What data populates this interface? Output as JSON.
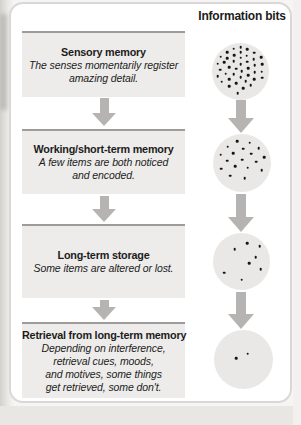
{
  "heading": "Information bits",
  "stages": [
    {
      "title": "Sensory memory",
      "description": "The senses momentarily register\namazing detail."
    },
    {
      "title": "Working/short-term memory",
      "description": "A few items are both noticed\nand encoded."
    },
    {
      "title": "Long-term storage",
      "description": "Some items are altered or lost."
    },
    {
      "title": "Retrieval from long-term memory",
      "description": "Depending on interference,\nretrieval cues, moods,\nand motives, some things\nget retrieved, some don't."
    }
  ],
  "circles": [
    {
      "name": "sensory-memory-bits",
      "dot_count": 42,
      "dots": [
        [
          50,
          7
        ],
        [
          38,
          10
        ],
        [
          62,
          11
        ],
        [
          27,
          16
        ],
        [
          74,
          17
        ],
        [
          50,
          16
        ],
        [
          15,
          24
        ],
        [
          39,
          21
        ],
        [
          61,
          22
        ],
        [
          86,
          25
        ],
        [
          27,
          27
        ],
        [
          50,
          26
        ],
        [
          73,
          28
        ],
        [
          10,
          36
        ],
        [
          21,
          34
        ],
        [
          38,
          32
        ],
        [
          62,
          33
        ],
        [
          88,
          37
        ],
        [
          50,
          37
        ],
        [
          75,
          39
        ],
        [
          30,
          42
        ],
        [
          14,
          47
        ],
        [
          42,
          45
        ],
        [
          63,
          44
        ],
        [
          87,
          50
        ],
        [
          52,
          49
        ],
        [
          75,
          51
        ],
        [
          24,
          54
        ],
        [
          38,
          55
        ],
        [
          64,
          56
        ],
        [
          10,
          58
        ],
        [
          50,
          60
        ],
        [
          88,
          61
        ],
        [
          30,
          64
        ],
        [
          74,
          64
        ],
        [
          59,
          67
        ],
        [
          17,
          68
        ],
        [
          42,
          71
        ],
        [
          68,
          74
        ],
        [
          30,
          76
        ],
        [
          55,
          79
        ],
        [
          45,
          88
        ]
      ]
    },
    {
      "name": "working-memory-bits",
      "dot_count": 18,
      "dots": [
        [
          42,
          12
        ],
        [
          63,
          15
        ],
        [
          25,
          22
        ],
        [
          79,
          24
        ],
        [
          52,
          25
        ],
        [
          13,
          36
        ],
        [
          35,
          33
        ],
        [
          66,
          34
        ],
        [
          88,
          40
        ],
        [
          24,
          46
        ],
        [
          50,
          44
        ],
        [
          74,
          48
        ],
        [
          38,
          56
        ],
        [
          60,
          58
        ],
        [
          14,
          60
        ],
        [
          84,
          62
        ],
        [
          30,
          72
        ],
        [
          55,
          76
        ]
      ]
    },
    {
      "name": "long-term-storage-bits",
      "dot_count": 8,
      "dots": [
        [
          60,
          18
        ],
        [
          82,
          23
        ],
        [
          38,
          28
        ],
        [
          75,
          42
        ],
        [
          63,
          53
        ],
        [
          84,
          63
        ],
        [
          20,
          70
        ],
        [
          50,
          82
        ]
      ]
    },
    {
      "name": "retrieval-bits",
      "dot_count": 2,
      "dots": [
        [
          38,
          48
        ],
        [
          57,
          40
        ]
      ]
    }
  ],
  "colors": {
    "box_fill": "#edecea",
    "box_line": "#9d9c9a",
    "arrow": "#b5b4b2",
    "circle_fill": "#e9e8e6",
    "card_border": "#d9d8d6",
    "text": "#1c1c1c"
  }
}
